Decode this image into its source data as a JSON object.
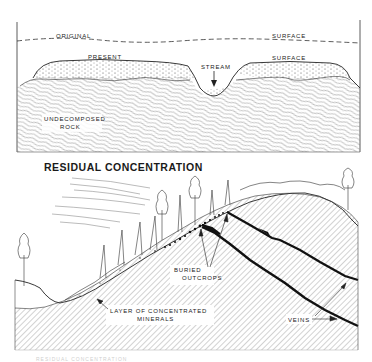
{
  "top_diagram": {
    "labels": {
      "original": "ORIGINAL",
      "surface_original": "SURFACE",
      "present": "PRESENT",
      "surface_present": "SURFACE",
      "stream": "STREAM",
      "undecomposed_1": "UNDECOMPOSED",
      "undecomposed_2": "ROCK"
    }
  },
  "section_title": "RESIDUAL CONCENTRATION",
  "bottom_diagram": {
    "labels": {
      "buried_1": "BURIED",
      "buried_2": "OUTCROPS",
      "layer_1": "LAYER OF CONCENTRATED",
      "layer_2": "MINERALS",
      "veins": "VEINS"
    }
  },
  "footer_caption": "RESIDUAL CONCENTRATION"
}
